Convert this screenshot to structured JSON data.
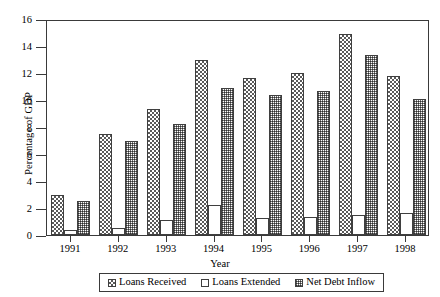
{
  "chart_data": {
    "type": "bar",
    "title": "",
    "xlabel": "Year",
    "ylabel": "Percentage of GDP",
    "categories": [
      "1991",
      "1992",
      "1993",
      "1994",
      "1995",
      "1996",
      "1997",
      "1998"
    ],
    "ylim": [
      0,
      16
    ],
    "ytick_step": 2,
    "yticks": [
      0,
      2,
      4,
      6,
      8,
      10,
      12,
      14,
      16
    ],
    "ytick_labels": [
      "0",
      "2",
      "4",
      "6",
      "8",
      "10",
      "12",
      "14",
      "16"
    ],
    "grid": false,
    "legend_position": "bottom",
    "series": [
      {
        "name": "Loans Received",
        "pattern": "checkerboard",
        "values": [
          3.0,
          7.5,
          9.3,
          13.0,
          11.6,
          12.0,
          14.9,
          11.75
        ]
      },
      {
        "name": "Loans Extended",
        "pattern": "empty",
        "values": [
          0.4,
          0.5,
          1.1,
          2.2,
          1.25,
          1.3,
          1.5,
          1.6
        ]
      },
      {
        "name": "Net Debt Inflow",
        "pattern": "fine-hatch",
        "values": [
          2.5,
          7.0,
          8.2,
          10.9,
          10.35,
          10.65,
          13.3,
          10.1
        ]
      }
    ]
  },
  "axis": {
    "y_title": "Percentage of GDP",
    "x_title": "Year"
  },
  "legend": {
    "items": [
      {
        "label": "Loans Received"
      },
      {
        "label": "Loans Extended"
      },
      {
        "label": "Net Debt Inflow"
      }
    ]
  },
  "colors": {
    "axis": "#3a3a3a",
    "bar_outline": "#3f3f3f",
    "pattern_dark": "#5a5a5a",
    "pattern_net": "#6e6e6e",
    "background": "#ffffff"
  }
}
